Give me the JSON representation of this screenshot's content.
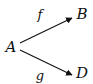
{
  "diagram": {
    "nodes": [
      {
        "id": "A",
        "label": "A",
        "x": 11,
        "y": 47
      },
      {
        "id": "B",
        "label": "B",
        "x": 82,
        "y": 14
      },
      {
        "id": "D",
        "label": "D",
        "x": 82,
        "y": 73
      }
    ],
    "edges": [
      {
        "from": "A",
        "to": "B",
        "label": "f",
        "label_x": 40,
        "label_y": 14
      },
      {
        "from": "A",
        "to": "D",
        "label": "g",
        "label_x": 40,
        "label_y": 75
      }
    ],
    "colors": {
      "stroke": "#111111",
      "background": "#ffffff"
    }
  }
}
